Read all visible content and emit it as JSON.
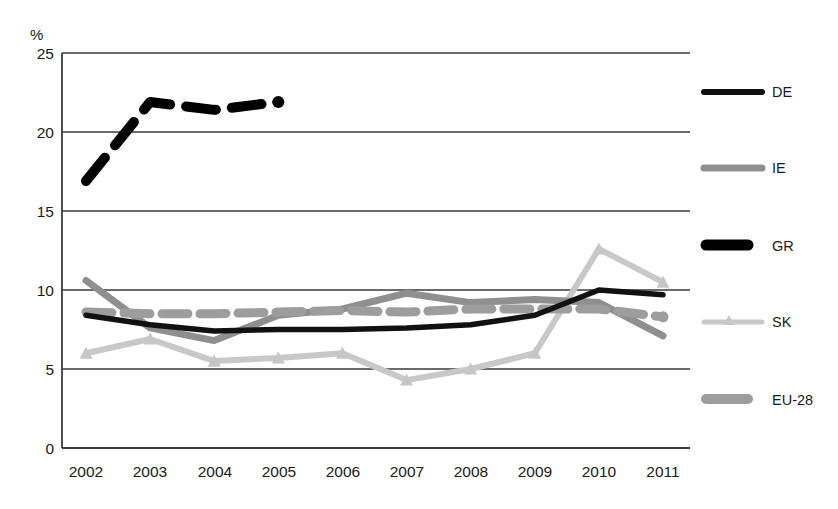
{
  "chart_data": {
    "type": "line",
    "title": "",
    "subtitle": "",
    "xlabel": "",
    "ylabel": "%",
    "ylim": [
      0,
      25
    ],
    "yticks": [
      0,
      5,
      10,
      15,
      20,
      25
    ],
    "ytick_labels": [
      "0",
      "5",
      "10",
      "15",
      "20",
      "25"
    ],
    "grid": "horizontal",
    "legend_position": "right",
    "categories": [
      "2002",
      "2003",
      "2004",
      "2005",
      "2006",
      "2007",
      "2008",
      "2009",
      "2010",
      "2011"
    ],
    "x": [
      2002,
      2003,
      2004,
      2005,
      2006,
      2007,
      2008,
      2009,
      2010,
      2011
    ],
    "series": [
      {
        "name": "DE",
        "style": "solid-thin-black",
        "color": "#111111",
        "values": [
          8.4,
          7.8,
          7.4,
          7.5,
          7.5,
          7.6,
          7.8,
          8.4,
          10.0,
          9.7
        ]
      },
      {
        "name": "IE",
        "style": "solid-gray",
        "color": "#8c8c8c",
        "values": [
          10.6,
          7.6,
          6.8,
          8.4,
          8.8,
          9.8,
          9.2,
          9.4,
          9.2,
          7.1
        ]
      },
      {
        "name": "GR",
        "style": "dashed-thick-black",
        "color": "#000000",
        "note": "partial series, data only 2002-2005 with final marker dot",
        "values": [
          16.9,
          21.9,
          21.4,
          21.9,
          null,
          null,
          null,
          null,
          null,
          null
        ]
      },
      {
        "name": "SK",
        "style": "marker-line-light-gray",
        "color": "#c6c6c6",
        "values": [
          6.0,
          6.9,
          5.5,
          5.7,
          6.0,
          4.3,
          5.0,
          6.0,
          12.6,
          10.5
        ]
      },
      {
        "name": "EU-28",
        "style": "dashed-thick-gray",
        "color": "#9a9a9a",
        "values": [
          8.6,
          8.5,
          8.5,
          8.6,
          8.7,
          8.6,
          8.8,
          8.8,
          8.8,
          8.3
        ]
      }
    ]
  },
  "axis": {
    "y_unit_label": "%"
  },
  "legend": {
    "items": [
      {
        "label": "DE",
        "swatch": "line-swatch-de"
      },
      {
        "label": "IE",
        "swatch": "line-swatch-ie"
      },
      {
        "label": "GR",
        "swatch": "line-swatch-gr"
      },
      {
        "label": "SK",
        "swatch": "line-swatch-sk"
      },
      {
        "label": "EU-28",
        "swatch": "line-swatch-eu28"
      }
    ]
  }
}
